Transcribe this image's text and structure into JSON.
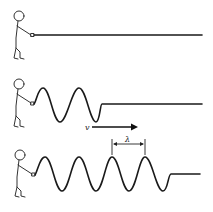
{
  "diagram": {
    "title": "",
    "panels": [
      {
        "id": "rest",
        "description": "Person holding a straight rope at rest"
      },
      {
        "id": "pulse",
        "description": "Person shaking rope producing two wave cycles traveling right",
        "velocity_label": "v"
      },
      {
        "id": "train",
        "description": "Longer wave train with wavelength marked",
        "wavelength_label": "λ"
      }
    ],
    "colors": {
      "line": "#1a1a1a",
      "figure": "#333333",
      "background": "#ffffff"
    }
  }
}
